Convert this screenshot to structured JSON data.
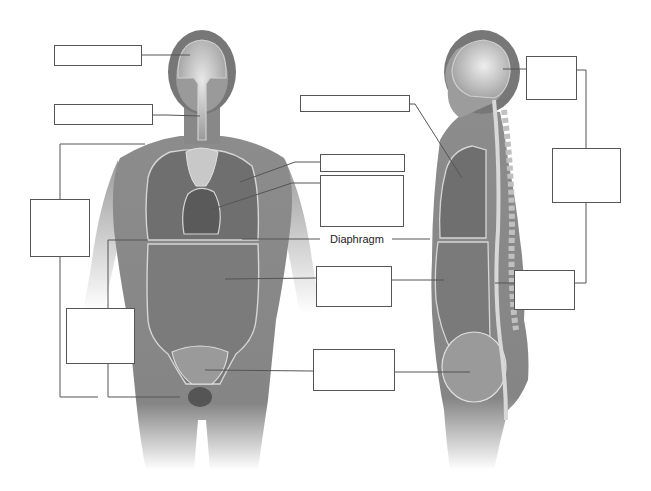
{
  "diagram": {
    "type": "anatomy-labeling",
    "views": [
      "anterior-view",
      "lateral-view"
    ],
    "labels": {
      "diaphragm": "Diaphragm"
    },
    "blank_boxes": [
      {
        "id": "cranial-cavity-front",
        "x": 54,
        "y": 45,
        "w": 88,
        "h": 21
      },
      {
        "id": "vertebral-canal-front",
        "x": 54,
        "y": 104,
        "w": 99,
        "h": 21
      },
      {
        "id": "dorsal-or-ventral-front",
        "x": 30,
        "y": 199,
        "w": 60,
        "h": 58
      },
      {
        "id": "thoracic-sub-front",
        "x": 66,
        "y": 308,
        "w": 69,
        "h": 56
      },
      {
        "id": "pleural-cavity",
        "x": 320,
        "y": 154,
        "w": 85,
        "h": 18
      },
      {
        "id": "pericardial-cavity",
        "x": 320,
        "y": 175,
        "w": 84,
        "h": 52
      },
      {
        "id": "abdominal-cavity",
        "x": 316,
        "y": 266,
        "w": 76,
        "h": 41
      },
      {
        "id": "pelvic-cavity",
        "x": 313,
        "y": 349,
        "w": 82,
        "h": 42
      },
      {
        "id": "thoracic-cavity-side",
        "x": 300,
        "y": 95,
        "w": 110,
        "h": 17
      },
      {
        "id": "cranial-cavity-side",
        "x": 526,
        "y": 56,
        "w": 51,
        "h": 44
      },
      {
        "id": "dorsal-cavity-side",
        "x": 552,
        "y": 148,
        "w": 69,
        "h": 55
      },
      {
        "id": "vertebral-canal-side",
        "x": 514,
        "y": 270,
        "w": 61,
        "h": 40
      }
    ],
    "colors": {
      "box_border": "#555555",
      "leader_line": "#555555",
      "body_fill": "#8a8a8a",
      "cavity_outline": "#d8d8d8",
      "background": "#ffffff"
    }
  }
}
